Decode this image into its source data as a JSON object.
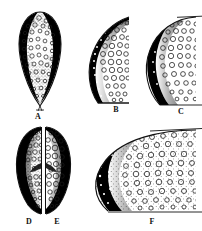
{
  "figure": {
    "background_color": "#ffffff",
    "ink_color": "#000000",
    "outline_color": "#1a1a1a",
    "width": 202,
    "height": 231,
    "panel_labels": [
      "A",
      "B",
      "C",
      "D",
      "E",
      "F"
    ]
  },
  "panels": [
    {
      "id": "panel-a",
      "label": "A",
      "label_x": 38,
      "label_y": 112,
      "shape": "teardrop-oval",
      "description": "Ovoid body tapering to a point at the base, stippled throughout with small circular vacuoles, dark crescent shading on both the left and right margins",
      "dark_regions": [
        "left-margin-crescent",
        "right-margin-crescent"
      ],
      "vacuole_density": "high",
      "vacuole_size": "small"
    },
    {
      "id": "panel-b",
      "label": "B",
      "label_x": 116,
      "label_y": 112,
      "shape": "half-moon",
      "description": "D-shaped half section, solid black crescent along the left convex margin containing small white dots, interior filled with medium circular vacuoles",
      "dark_regions": [
        "left-convex-crescent"
      ],
      "vacuole_density": "medium",
      "vacuole_size": "medium"
    },
    {
      "id": "panel-c",
      "label": "C",
      "label_x": 181,
      "label_y": 114,
      "shape": "half-moon-truncated",
      "description": "Half section truncated at the right edge of the frame, thick solid black crescent along the left margin grading through stipple into an interior of circular vacuoles",
      "dark_regions": [
        "left-convex-crescent-thick"
      ],
      "vacuole_density": "medium",
      "vacuole_size": "medium"
    },
    {
      "id": "panel-d",
      "label": "D",
      "label_x": 29,
      "label_y": 221,
      "shape": "left-half-oval",
      "description": "Left half of a split oval, dark crescent on the outer left margin, dense small vacuoles and stipple inside, flat cut face on the right",
      "dark_regions": [
        "left-outer-crescent",
        "inner-right-wedge"
      ],
      "vacuole_density": "high",
      "vacuole_size": "small"
    },
    {
      "id": "panel-e",
      "label": "E",
      "label_x": 57,
      "label_y": 221,
      "shape": "right-half-oval",
      "description": "Right half of the same split oval, dark crescent on the outer right margin, larger circular vacuoles inside, flat cut face on the left",
      "dark_regions": [
        "right-outer-crescent",
        "inner-left-wedge"
      ],
      "vacuole_density": "medium",
      "vacuole_size": "large"
    },
    {
      "id": "panel-f",
      "label": "F",
      "label_x": 152,
      "label_y": 222,
      "shape": "large-half-moon",
      "description": "Large D-shaped section truncated at the right frame edge, very thick black crescent with white speckles on the left margin, interior packed with circular vacuoles of mixed sizes and fine stipple",
      "dark_regions": [
        "left-convex-crescent-very-thick"
      ],
      "vacuole_density": "high",
      "vacuole_size": "mixed"
    }
  ]
}
